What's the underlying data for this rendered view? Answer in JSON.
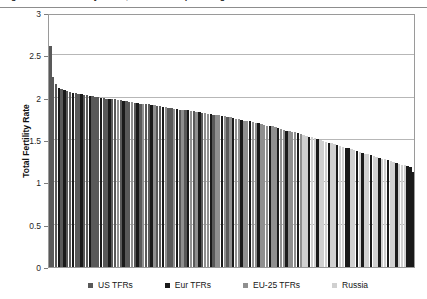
{
  "figure": {
    "caption": "Figure 1. Total Fertility Rates, US and European Regions"
  },
  "chart_data": {
    "type": "bar",
    "title": "",
    "xlabel": "",
    "ylabel": "Total Fertility Rate",
    "ylim": [
      0,
      3
    ],
    "yticks": [
      "0",
      "0.5",
      "1",
      "1.5",
      "2",
      "2.5",
      "3"
    ],
    "ytick_values": [
      0,
      0.5,
      1,
      1.5,
      2,
      2.5,
      3
    ],
    "grid": true,
    "legend_position": "bottom",
    "xaxis_ticklabels": [],
    "series": [
      {
        "name": "US TFRs",
        "color": "#595959"
      },
      {
        "name": "Eur TFRs",
        "color": "#1a1a1a"
      },
      {
        "name": "EU-25 TFRs",
        "color": "#8f8f8f"
      },
      {
        "name": "Russia",
        "color": "#d0d0d0"
      }
    ],
    "values": [
      2.61,
      2.25,
      2.16,
      2.11,
      2.1,
      2.09,
      2.08,
      2.07,
      2.06,
      2.05,
      2.04,
      2.04,
      2.03,
      2.03,
      2.02,
      2.02,
      2.01,
      2.01,
      2.0,
      2.0,
      1.99,
      1.99,
      1.98,
      1.98,
      1.97,
      1.97,
      1.96,
      1.96,
      1.95,
      1.95,
      1.94,
      1.94,
      1.93,
      1.93,
      1.92,
      1.92,
      1.91,
      1.91,
      1.9,
      1.9,
      1.89,
      1.89,
      1.88,
      1.88,
      1.87,
      1.87,
      1.86,
      1.86,
      1.85,
      1.85,
      1.84,
      1.84,
      1.83,
      1.83,
      1.82,
      1.82,
      1.81,
      1.81,
      1.8,
      1.8,
      1.79,
      1.78,
      1.78,
      1.77,
      1.77,
      1.76,
      1.75,
      1.75,
      1.74,
      1.73,
      1.73,
      1.72,
      1.71,
      1.7,
      1.7,
      1.69,
      1.68,
      1.67,
      1.66,
      1.66,
      1.65,
      1.64,
      1.63,
      1.62,
      1.61,
      1.61,
      1.6,
      1.59,
      1.58,
      1.57,
      1.56,
      1.55,
      1.54,
      1.53,
      1.52,
      1.51,
      1.5,
      1.49,
      1.48,
      1.47,
      1.46,
      1.45,
      1.44,
      1.43,
      1.42,
      1.41,
      1.4,
      1.39,
      1.38,
      1.37,
      1.36,
      1.35,
      1.34,
      1.33,
      1.32,
      1.31,
      1.3,
      1.29,
      1.28,
      1.27,
      1.26,
      1.25,
      1.24,
      1.23,
      1.22,
      1.21,
      1.2,
      1.19,
      1.18,
      1.12
    ],
    "series_index": [
      0,
      0,
      0,
      1,
      0,
      1,
      0,
      0,
      1,
      0,
      0,
      1,
      0,
      0,
      1,
      0,
      0,
      0,
      1,
      0,
      0,
      1,
      0,
      0,
      2,
      0,
      1,
      0,
      0,
      2,
      0,
      1,
      0,
      2,
      0,
      0,
      1,
      2,
      0,
      0,
      1,
      2,
      0,
      0,
      2,
      1,
      0,
      2,
      0,
      1,
      2,
      0,
      2,
      1,
      0,
      2,
      2,
      1,
      0,
      2,
      2,
      1,
      2,
      0,
      2,
      1,
      2,
      2,
      1,
      2,
      2,
      1,
      2,
      2,
      1,
      2,
      2,
      2,
      1,
      2,
      2,
      1,
      2,
      2,
      1,
      2,
      2,
      2,
      1,
      2,
      3,
      3,
      1,
      3,
      3,
      1,
      3,
      3,
      3,
      1,
      3,
      3,
      1,
      3,
      3,
      1,
      1,
      3,
      3,
      1,
      3,
      1,
      3,
      3,
      1,
      3,
      3,
      1,
      3,
      3,
      1,
      3,
      3,
      1,
      3,
      3,
      3,
      1,
      1,
      1
    ]
  },
  "legend": {
    "items": [
      {
        "label": "US TFRs",
        "color": "#595959"
      },
      {
        "label": "Eur TFRs",
        "color": "#1a1a1a"
      },
      {
        "label": "EU-25 TFRs",
        "color": "#8f8f8f"
      },
      {
        "label": "Russia",
        "color": "#d0d0d0"
      }
    ]
  }
}
